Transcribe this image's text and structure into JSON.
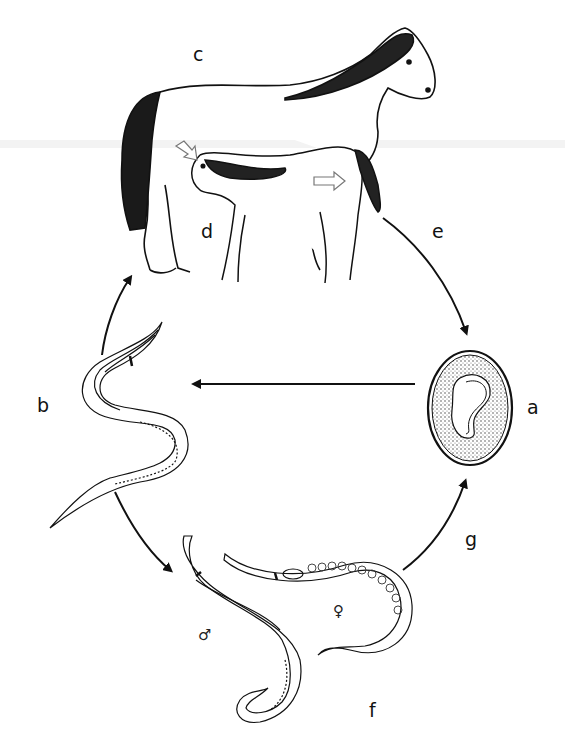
{
  "diagram": {
    "type": "life-cycle",
    "stages": [
      {
        "id": "a",
        "label": "a",
        "depicts": "embryonated egg"
      },
      {
        "id": "b",
        "label": "b",
        "depicts": "larva"
      },
      {
        "id": "c",
        "label": "c",
        "depicts": "mare (adult horse)"
      },
      {
        "id": "d",
        "label": "d",
        "depicts": "foal suckling"
      },
      {
        "id": "e",
        "label": "e",
        "depicts": "transmission to egg"
      },
      {
        "id": "f",
        "label": "f",
        "depicts": "adult worms male and female"
      },
      {
        "id": "g",
        "label": "g",
        "depicts": "eggs released"
      }
    ],
    "symbols": {
      "male": "♂",
      "female": "♀"
    },
    "edges": [
      {
        "from": "b",
        "to": "c"
      },
      {
        "from": "c",
        "to": "a",
        "label": "e"
      },
      {
        "from": "a",
        "to": "b"
      },
      {
        "from": "b",
        "to": "f"
      },
      {
        "from": "f",
        "to": "a",
        "label": "g"
      }
    ]
  }
}
